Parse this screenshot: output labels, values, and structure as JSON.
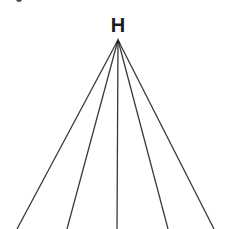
{
  "diagram": {
    "type": "tree-fan",
    "root": {
      "label": "H",
      "x": 118,
      "y": 40
    },
    "edges": [
      {
        "from": "H",
        "x2": 17,
        "y2": 229
      },
      {
        "from": "H",
        "x2": 67,
        "y2": 229
      },
      {
        "from": "H",
        "x2": 117,
        "y2": 229
      },
      {
        "from": "H",
        "x2": 168,
        "y2": 229
      },
      {
        "from": "H",
        "x2": 214,
        "y2": 229
      }
    ],
    "colors": {
      "line": "#3a3a3a",
      "label": "#1c1c1c",
      "background": "#ffffff"
    }
  }
}
